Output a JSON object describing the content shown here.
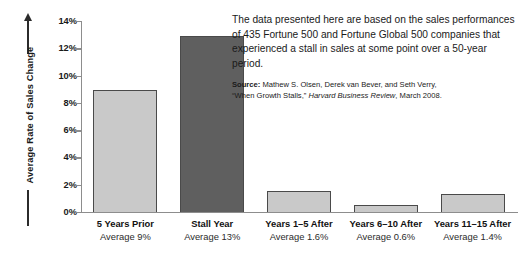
{
  "chart_data": {
    "type": "bar",
    "title": "",
    "xlabel": "",
    "ylabel": "Average Rate of Sales Change",
    "ylim": [
      0,
      14
    ],
    "y_tick_labels": [
      "0%",
      "2%",
      "4%",
      "6%",
      "8%",
      "10%",
      "12%",
      "14%"
    ],
    "y_tick_values": [
      0,
      2,
      4,
      6,
      8,
      10,
      12,
      14
    ],
    "grid": false,
    "legend": "none",
    "categories": [
      "5 Years Prior",
      "Stall Year",
      "Years 1–5 After",
      "Years 6–10 After",
      "Years 11–15 After"
    ],
    "category_sublabels": [
      "Average 9%",
      "Average 13%",
      "Average 1.6%",
      "Average 0.6%",
      "Average 1.4%"
    ],
    "values": [
      9,
      13,
      1.6,
      0.6,
      1.4
    ],
    "bar_colors": [
      "#c9c9c9",
      "#5f5f5f",
      "#c9c9c9",
      "#c9c9c9",
      "#c9c9c9"
    ],
    "bar_edge_color": "#4a4a4a",
    "highlight_category": "Stall Year"
  },
  "axis": {
    "y_title": "Average Rate of Sales Change",
    "arrow_icon": "up-arrow-icon"
  },
  "annotation": {
    "body": "The data presented here are based on the sales performances of 435 Fortune 500 and Fortune Global 500 companies that experienced a stall in sales at some point over a 50-year period.",
    "source_label": "Source:",
    "source_authors": "Mathew S. Olsen, Derek van Bever, and Seth Verry,",
    "source_title": "“When Growth Stalls,”",
    "source_journal": "Harvard Business Review",
    "source_date": ", March 2008."
  },
  "colors": {
    "bar_light": "#c9c9c9",
    "bar_dark": "#5f5f5f",
    "axis": "#8d8d8d",
    "text": "#1a1a1a",
    "background": "#ffffff"
  }
}
